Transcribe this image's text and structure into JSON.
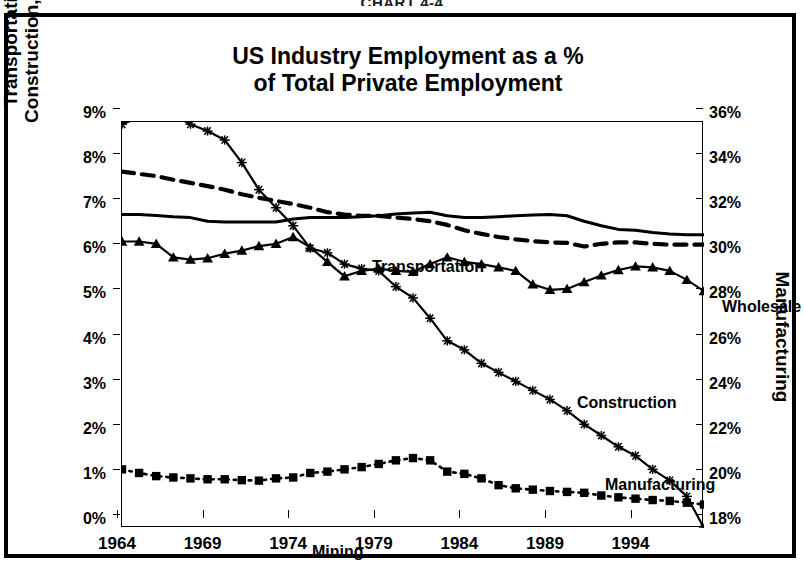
{
  "caption": "CHART 4-4",
  "title": {
    "line1": "US Industry Employment as a %",
    "line2": "of Total Private Employment"
  },
  "axes": {
    "left_title_line1": "Transportation, Mining,",
    "left_title_line2": "Construction, & Wholesale",
    "right_title": "Manufacturing",
    "left_ticks": [
      "9%",
      "8%",
      "7%",
      "6%",
      "5%",
      "4%",
      "3%",
      "2%",
      "1%",
      "0%"
    ],
    "right_ticks": [
      "36%",
      "34%",
      "32%",
      "30%",
      "28%",
      "26%",
      "24%",
      "22%",
      "20%",
      "18%"
    ],
    "x_ticks": [
      "1964",
      "1969",
      "1974",
      "1979",
      "1984",
      "1989",
      "1994"
    ]
  },
  "series_labels": {
    "transportation": "Transportation",
    "wholesale": "Wholesale",
    "construction": "Construction",
    "manufacturing": "Manufacturing",
    "mining": "Mining"
  },
  "colors": {
    "ink": "#000000",
    "background": "#ffffff"
  },
  "chart_data": {
    "type": "line",
    "title": "US Industry Employment as a % of Total Private Employment",
    "xlabel": "",
    "ylabel": "Transportation, Mining, Construction, & Wholesale",
    "y2label": "Manufacturing",
    "xlim": [
      1964,
      1998
    ],
    "ylim": [
      0,
      9
    ],
    "y2lim": [
      18,
      36
    ],
    "grid": false,
    "legend": "inline-labels",
    "x": [
      1964,
      1965,
      1966,
      1967,
      1968,
      1969,
      1970,
      1971,
      1972,
      1973,
      1974,
      1975,
      1976,
      1977,
      1978,
      1979,
      1980,
      1981,
      1982,
      1983,
      1984,
      1985,
      1986,
      1987,
      1988,
      1989,
      1990,
      1991,
      1992,
      1993,
      1994,
      1995,
      1996,
      1997,
      1998
    ],
    "series": [
      {
        "name": "Transportation",
        "axis": "left",
        "unit": "%",
        "marker": "none",
        "linestyle": "dashed",
        "values": [
          7.9,
          7.85,
          7.8,
          7.72,
          7.65,
          7.58,
          7.5,
          7.4,
          7.32,
          7.25,
          7.18,
          7.1,
          7.0,
          6.95,
          6.92,
          6.92,
          6.88,
          6.85,
          6.8,
          6.72,
          6.6,
          6.52,
          6.45,
          6.4,
          6.36,
          6.33,
          6.32,
          6.24,
          6.3,
          6.33,
          6.33,
          6.3,
          6.28,
          6.28,
          6.28
        ]
      },
      {
        "name": "Wholesale",
        "axis": "left",
        "unit": "%",
        "marker": "none",
        "linestyle": "solid",
        "values": [
          6.95,
          6.95,
          6.93,
          6.9,
          6.88,
          6.8,
          6.78,
          6.78,
          6.78,
          6.78,
          6.85,
          6.88,
          6.88,
          6.88,
          6.9,
          6.92,
          6.96,
          6.98,
          7.0,
          6.92,
          6.88,
          6.88,
          6.9,
          6.92,
          6.94,
          6.95,
          6.92,
          6.8,
          6.7,
          6.62,
          6.6,
          6.55,
          6.52,
          6.5,
          6.5
        ]
      },
      {
        "name": "Construction",
        "axis": "left",
        "unit": "%",
        "marker": "triangle",
        "linestyle": "solid",
        "values": [
          6.35,
          6.35,
          6.3,
          6.0,
          5.95,
          5.98,
          6.08,
          6.15,
          6.25,
          6.3,
          6.45,
          6.22,
          5.9,
          5.58,
          5.7,
          5.75,
          5.7,
          5.68,
          5.85,
          6.0,
          5.9,
          5.85,
          5.78,
          5.7,
          5.4,
          5.28,
          5.3,
          5.45,
          5.6,
          5.72,
          5.8,
          5.78,
          5.7,
          5.5,
          5.25
        ]
      },
      {
        "name": "Manufacturing",
        "axis": "right",
        "unit": "%",
        "marker": "star",
        "linestyle": "solid",
        "values": [
          35.9,
          36.2,
          36.5,
          36.3,
          35.9,
          35.6,
          35.2,
          34.2,
          33.0,
          32.2,
          31.4,
          30.4,
          30.2,
          29.7,
          29.5,
          29.4,
          28.7,
          28.2,
          27.3,
          26.3,
          25.9,
          25.3,
          24.9,
          24.5,
          24.1,
          23.7,
          23.2,
          22.6,
          22.1,
          21.6,
          21.2,
          20.6,
          20.1,
          19.4,
          18.0
        ]
      },
      {
        "name": "Mining",
        "axis": "left",
        "unit": "%",
        "marker": "square",
        "linestyle": "dotted",
        "values": [
          1.3,
          1.22,
          1.15,
          1.12,
          1.1,
          1.08,
          1.08,
          1.06,
          1.05,
          1.1,
          1.12,
          1.22,
          1.25,
          1.3,
          1.35,
          1.42,
          1.5,
          1.55,
          1.5,
          1.25,
          1.2,
          1.1,
          0.95,
          0.88,
          0.85,
          0.82,
          0.8,
          0.78,
          0.72,
          0.68,
          0.65,
          0.62,
          0.6,
          0.56,
          0.52
        ]
      }
    ]
  }
}
